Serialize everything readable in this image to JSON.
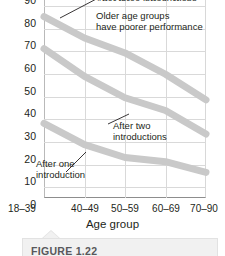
{
  "chart_data": {
    "type": "line",
    "title": "",
    "xlabel": "Age group",
    "ylabel": "",
    "categories": [
      "18–39",
      "40–49",
      "50–59",
      "60–69",
      "70–90"
    ],
    "ylim": [
      0,
      90
    ],
    "ytick_step": 10,
    "yticks": [
      "90",
      "80",
      "70",
      "60",
      "50",
      "40",
      "30",
      "20",
      "10",
      "0"
    ],
    "grid": "both",
    "legend_position": "none",
    "note": "Top of plot is cropped; y-axis visible from 0 to 90.",
    "series": [
      {
        "name": "After three introductions",
        "values": [
          85,
          75,
          68,
          58,
          46
        ],
        "color": "#c9c9c9"
      },
      {
        "name": "After two introductions",
        "values": [
          70,
          57,
          47,
          41,
          30
        ],
        "color": "#c9c9c9"
      },
      {
        "name": "After one introduction",
        "values": [
          35,
          25,
          19,
          17,
          12
        ],
        "color": "#c9c9c9"
      }
    ],
    "annotations": [
      {
        "id": "cut-off-top",
        "text": "After three introductions",
        "clipped": true
      },
      {
        "id": "older-age-groups",
        "text_line1": "Older age groups",
        "text_line2": "have poorer performance"
      },
      {
        "id": "after-two",
        "text_line1": "After two",
        "text_line2": "introductions"
      },
      {
        "id": "after-one",
        "text_line1": "After one",
        "text_line2": "introduction"
      }
    ]
  },
  "axis": {
    "x_title": "Age group",
    "x_ticks": [
      "18–39",
      "40–49",
      "50–59",
      "60–69",
      "70–90"
    ],
    "y_ticks": [
      "90",
      "80",
      "70",
      "60",
      "50",
      "40",
      "30",
      "20",
      "10",
      "0"
    ]
  },
  "annotations": {
    "clipped_top": "After three introductions",
    "older_line1": "Older age groups",
    "older_line2": "have poorer performance",
    "two_line1": "After two",
    "two_line2": "introductions",
    "one_line1": "After one",
    "one_line2": "introduction"
  },
  "caption": {
    "label": "FIGURE 1.22"
  },
  "colors": {
    "line": "#c9c9c9",
    "grid": "#d9d9d9",
    "axis": "#8d8d8d",
    "text": "#231f20",
    "caption_bg": "#f1f1f1",
    "caption_text": "#58585b"
  }
}
